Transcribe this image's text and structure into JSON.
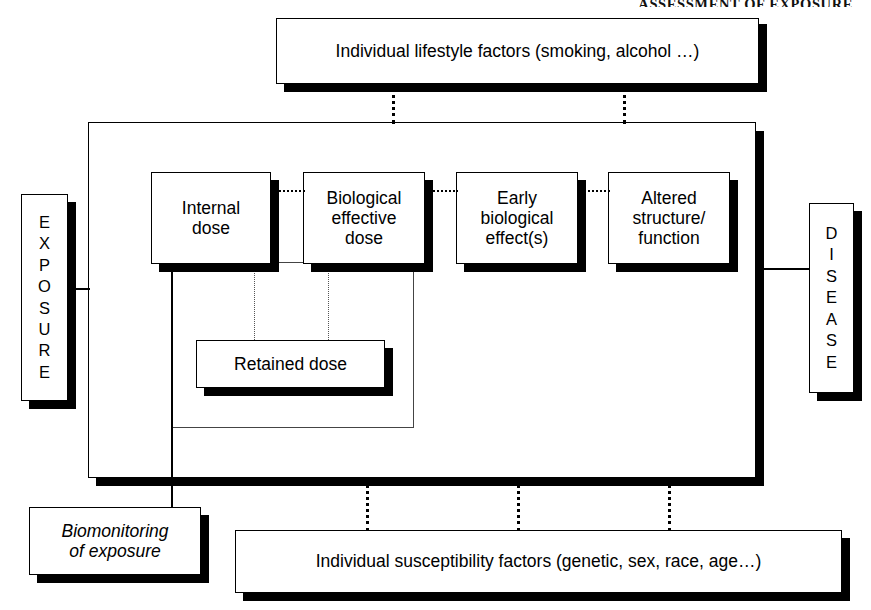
{
  "header": {
    "text": "ASSESSMENT OF EXPOSURE"
  },
  "diagram": {
    "top_modifier": {
      "label": "Individual lifestyle factors (smoking, alcohol …)"
    },
    "bottom_modifier": {
      "label": "Individual susceptibility factors (genetic, sex, race, age…)"
    },
    "left_endpoint": {
      "label": "EXPOSURE",
      "letters": [
        "E",
        "X",
        "P",
        "O",
        "S",
        "U",
        "R",
        "E"
      ]
    },
    "right_endpoint": {
      "label": "DISEASE",
      "letters": [
        "D",
        "I",
        "S",
        "E",
        "A",
        "S",
        "E"
      ]
    },
    "stages": [
      {
        "id": "internal-dose",
        "label": "Internal dose",
        "lines": [
          "Internal",
          "dose"
        ]
      },
      {
        "id": "biological-effective-dose",
        "label": "Biological effective dose",
        "lines": [
          "Biological",
          "effective",
          "dose"
        ]
      },
      {
        "id": "early-biological-effect",
        "label": "Early biological effect(s)",
        "lines": [
          "Early",
          "biological",
          "effect(s)"
        ]
      },
      {
        "id": "altered-structure-function",
        "label": "Altered structure/ function",
        "lines": [
          "Altered",
          "structure/",
          "function"
        ]
      }
    ],
    "retained": {
      "label": "Retained dose"
    },
    "biomonitoring": {
      "label": "Biomonitoring of exposure",
      "lines": [
        "Biomonitoring",
        "of exposure"
      ]
    },
    "colors": {
      "ink": "#000000",
      "paper": "#ffffff",
      "shadow": "#000000"
    }
  }
}
